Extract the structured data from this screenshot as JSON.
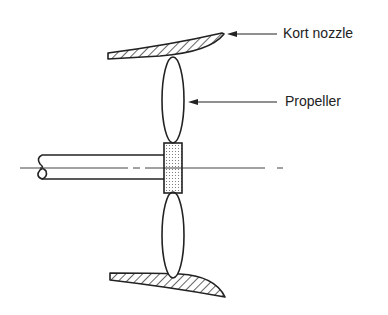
{
  "diagram": {
    "type": "propeller-in-nozzle cross-section",
    "labels": {
      "kort_nozzle": "Kort nozzle",
      "propeller": "Propeller"
    },
    "colors": {
      "line": "#222222",
      "background": "#ffffff"
    }
  }
}
